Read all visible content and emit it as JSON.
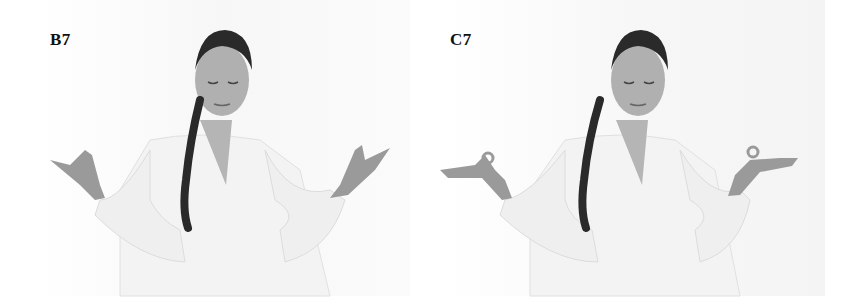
{
  "figure": {
    "panels": [
      {
        "label": "B7",
        "description": "Woman seated, eyes closed, both forearms raised with fingertips pinched upward in a mudra",
        "hands": "fingers pointing upward"
      },
      {
        "label": "C7",
        "description": "Woman seated, eyes closed, palms facing up with thumb and index finger touching (circle mudra)",
        "hands": "palms up, fingertips touching"
      }
    ],
    "colors": {
      "background": "#ffffff",
      "skin": "#a8a8a8",
      "hair": "#2a2a2a",
      "shirt": "#f2f2f2",
      "label": "#111111"
    }
  }
}
